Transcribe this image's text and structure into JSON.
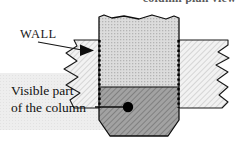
{
  "figure": {
    "top_caption": "column plan view",
    "labels": {
      "wall": "WALL",
      "visible_line1": "Visible part",
      "visible_line2": "of the column"
    }
  },
  "colors": {
    "page_background": "#ffffff",
    "wall_fill": "#f0f0f0",
    "wall_hatch": "#b9b9b9",
    "column_upper_fill": "#d8d8d8",
    "column_upper_dots": "#b0b0b0",
    "column_lower_fill": "#9c9c9c",
    "column_lower_hatch": "#6e6e6e",
    "text_backdrop": "#ededed",
    "outline": "#000000",
    "dot_marker": "#000000",
    "caption_text": "#5b5b5b"
  },
  "geometry": {
    "canvas_width": 236,
    "canvas_height": 142,
    "wall_top_y": 40,
    "wall_bottom_y": 108,
    "column_left_x": 99,
    "column_right_x": 179,
    "column_top_y": 17,
    "column_bottom_y": 136,
    "fill_transition_y": 87,
    "marker_x": 128,
    "marker_y": 107
  }
}
